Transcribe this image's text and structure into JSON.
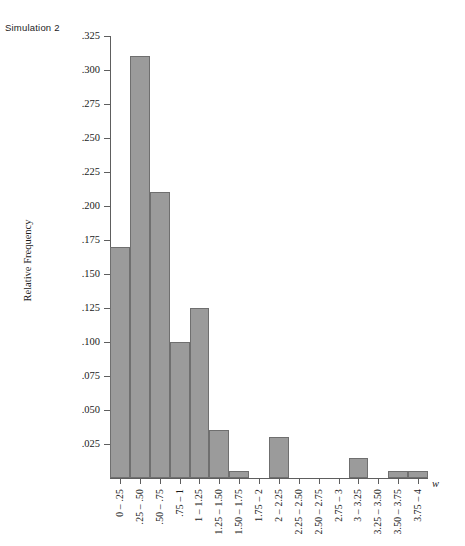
{
  "caption": "Simulation 2",
  "axis": {
    "y_title": "Relative Frequency",
    "x_title": "w"
  },
  "colors": {
    "bar_fill": "#9b9b9b",
    "bar_stroke": "#6f6f6f",
    "axis": "#5e5e5e",
    "text": "#1a1a1a",
    "background": "#ffffff"
  },
  "chart_data": {
    "type": "bar",
    "title": "Simulation 2",
    "xlabel": "w",
    "ylabel": "Relative Frequency",
    "categories": [
      "0 – .25",
      ".25 – .50",
      ".50 – .75",
      ".75 – 1",
      "1 – 1.25",
      "1.25 – 1.50",
      "1.50 – 1.75",
      "1.75 – 2",
      "2 – 2.25",
      "2.25 – 2.50",
      "2.50 – 2.75",
      "2.75 – 3",
      "3 – 3.25",
      "3.25 – 3.50",
      "3.50 – 3.75",
      "3.75 – 4"
    ],
    "values": [
      0.17,
      0.31,
      0.21,
      0.1,
      0.125,
      0.035,
      0.005,
      0.0,
      0.03,
      0.0,
      0.0,
      0.0,
      0.015,
      0.0,
      0.005,
      0.005
    ],
    "ylim": [
      0,
      0.325
    ],
    "yticks": [
      0.025,
      0.05,
      0.075,
      0.1,
      0.125,
      0.15,
      0.175,
      0.2,
      0.225,
      0.25,
      0.275,
      0.3,
      0.325
    ],
    "ytick_labels": [
      ".025",
      ".050",
      ".075",
      ".100",
      ".125",
      ".150",
      ".175",
      ".200",
      ".225",
      ".250",
      ".275",
      ".300",
      ".325"
    ],
    "grid": false,
    "legend": false
  }
}
